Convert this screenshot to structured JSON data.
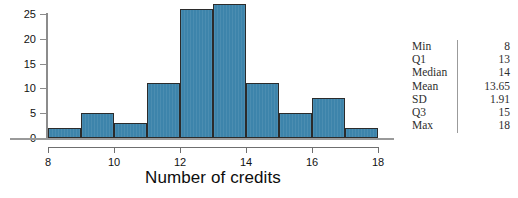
{
  "chart_data": {
    "type": "bar",
    "title": "",
    "xlabel": "Number of credits",
    "ylabel": "",
    "categories": [
      "8-9",
      "9-10",
      "10-11",
      "11-12",
      "12-13",
      "13-14",
      "14-15",
      "15-16",
      "16-17",
      "17-18"
    ],
    "bin_edges": [
      8,
      9,
      10,
      11,
      12,
      13,
      14,
      15,
      16,
      17,
      18
    ],
    "values": [
      2,
      5,
      3,
      11,
      26,
      27,
      11,
      5,
      8,
      2
    ],
    "xlim": [
      8,
      18
    ],
    "ylim": [
      0,
      25
    ],
    "xticks": [
      8,
      10,
      12,
      14,
      16,
      18
    ],
    "yticks": [
      0,
      5,
      10,
      15,
      20,
      25
    ],
    "xtick_labels": [
      "8",
      "10",
      "12",
      "14",
      "16",
      "18"
    ],
    "ytick_labels": [
      "0",
      "5",
      "10",
      "15",
      "20",
      "25"
    ],
    "grid": false,
    "legend": false,
    "bar_color": "#3d84ab",
    "bar_edge_color": "#2b2b2b",
    "axis_color": "#8c8c8c"
  },
  "stats": {
    "rows": [
      {
        "label": "Min",
        "value": "8"
      },
      {
        "label": "Q1",
        "value": "13"
      },
      {
        "label": "Median",
        "value": "14"
      },
      {
        "label": "Mean",
        "value": "13.65"
      },
      {
        "label": "SD",
        "value": "1.91"
      },
      {
        "label": "Q3",
        "value": "15"
      },
      {
        "label": "Max",
        "value": "18"
      }
    ]
  }
}
